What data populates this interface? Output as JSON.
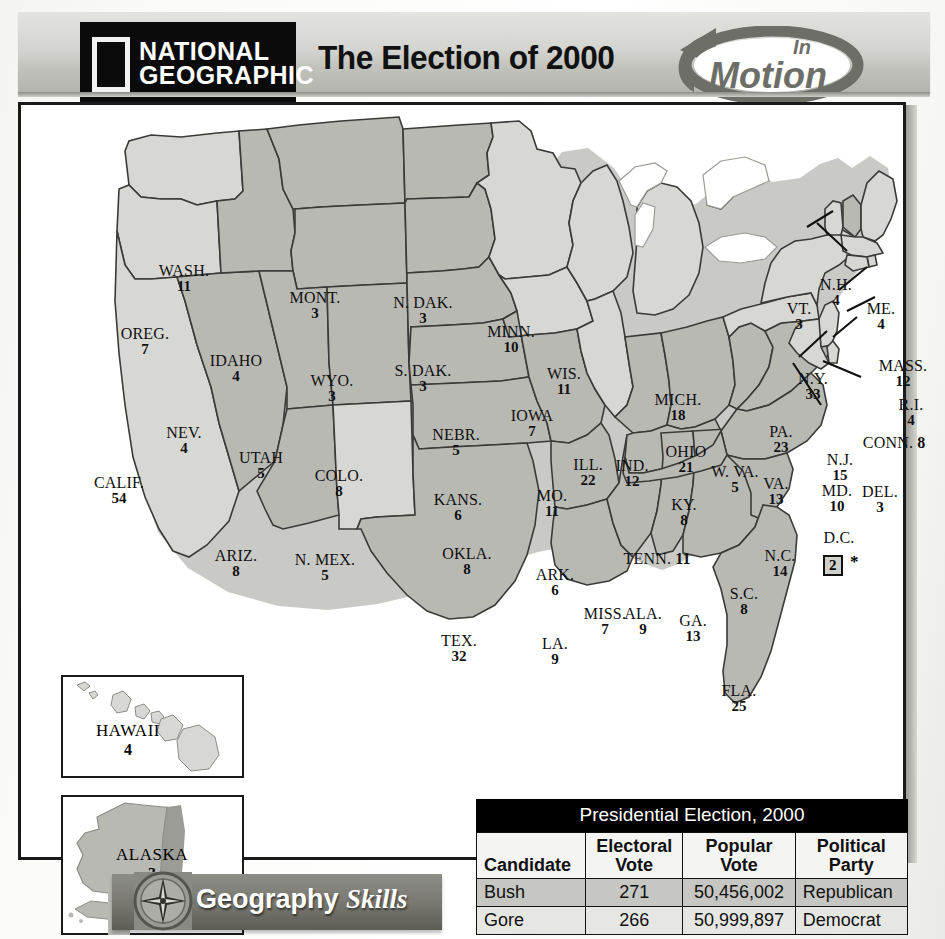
{
  "header": {
    "logo_line1": "NATIONAL",
    "logo_line2": "GEOGRAPHIC",
    "title": "The Election of 2000",
    "badge_line1": "In",
    "badge_line2": "Motion"
  },
  "map": {
    "title": "The Election of 2000",
    "legend": {
      "bush_fill": "#b9b9b4",
      "gore_fill": "#d7d7d3",
      "water_fill": "#ffffff",
      "coast_shadow": "#9c9c96",
      "border": "#3a3a38"
    },
    "states": [
      {
        "abbr": "WASH.",
        "votes": "11",
        "winner": "gore",
        "x": 163,
        "y": 158
      },
      {
        "abbr": "OREG.",
        "votes": "7",
        "winner": "gore",
        "x": 124,
        "y": 221
      },
      {
        "abbr": "CALIF.",
        "votes": "54",
        "winner": "gore",
        "x": 98,
        "y": 370
      },
      {
        "abbr": "NEV.",
        "votes": "4",
        "winner": "bush",
        "x": 163,
        "y": 320
      },
      {
        "abbr": "IDAHO",
        "votes": "4",
        "winner": "bush",
        "x": 215,
        "y": 248
      },
      {
        "abbr": "MONT.",
        "votes": "3",
        "winner": "bush",
        "x": 294,
        "y": 185
      },
      {
        "abbr": "WYO.",
        "votes": "3",
        "winner": "bush",
        "x": 311,
        "y": 268
      },
      {
        "abbr": "UTAH",
        "votes": "5",
        "winner": "bush",
        "x": 240,
        "y": 345
      },
      {
        "abbr": "COLO.",
        "votes": "8",
        "winner": "bush",
        "x": 318,
        "y": 363
      },
      {
        "abbr": "ARIZ.",
        "votes": "8",
        "winner": "bush",
        "x": 215,
        "y": 443
      },
      {
        "abbr": "N. MEX.",
        "votes": "5",
        "winner": "gore",
        "x": 304,
        "y": 447
      },
      {
        "abbr": "N. DAK.",
        "votes": "3",
        "winner": "bush",
        "x": 402,
        "y": 190
      },
      {
        "abbr": "S. DAK.",
        "votes": "3",
        "winner": "bush",
        "x": 402,
        "y": 258
      },
      {
        "abbr": "NEBR.",
        "votes": "5",
        "winner": "bush",
        "x": 435,
        "y": 322
      },
      {
        "abbr": "KANS.",
        "votes": "6",
        "winner": "bush",
        "x": 437,
        "y": 387
      },
      {
        "abbr": "OKLA.",
        "votes": "8",
        "winner": "bush",
        "x": 446,
        "y": 441
      },
      {
        "abbr": "TEX.",
        "votes": "32",
        "winner": "bush",
        "x": 438,
        "y": 528
      },
      {
        "abbr": "MINN.",
        "votes": "10",
        "winner": "gore",
        "x": 490,
        "y": 219
      },
      {
        "abbr": "IOWA",
        "votes": "7",
        "winner": "gore",
        "x": 511,
        "y": 303
      },
      {
        "abbr": "MO.",
        "votes": "11",
        "winner": "bush",
        "x": 531,
        "y": 383
      },
      {
        "abbr": "ARK.",
        "votes": "6",
        "winner": "bush",
        "x": 534,
        "y": 462
      },
      {
        "abbr": "LA.",
        "votes": "9",
        "winner": "bush",
        "x": 534,
        "y": 531
      },
      {
        "abbr": "WIS.",
        "votes": "11",
        "winner": "gore",
        "x": 543,
        "y": 261
      },
      {
        "abbr": "ILL.",
        "votes": "22",
        "winner": "gore",
        "x": 567,
        "y": 352
      },
      {
        "abbr": "MISS.",
        "votes": "7",
        "winner": "bush",
        "x": 584,
        "y": 501
      },
      {
        "abbr": "IND.",
        "votes": "12",
        "winner": "bush",
        "x": 611,
        "y": 353
      },
      {
        "abbr": "MICH.",
        "votes": "18",
        "winner": "gore",
        "x": 657,
        "y": 287
      },
      {
        "abbr": "OHIO",
        "votes": "21",
        "winner": "bush",
        "x": 665,
        "y": 339
      },
      {
        "abbr": "KY.",
        "votes": "8",
        "winner": "bush",
        "x": 663,
        "y": 392
      },
      {
        "abbr": "ALA.",
        "votes": "9",
        "winner": "bush",
        "x": 622,
        "y": 501
      },
      {
        "abbr": "GA.",
        "votes": "13",
        "winner": "bush",
        "x": 672,
        "y": 508
      },
      {
        "abbr": "W. VA.",
        "votes": "5",
        "winner": "bush",
        "x": 714,
        "y": 359
      },
      {
        "abbr": "VA.",
        "votes": "13",
        "winner": "bush",
        "x": 755,
        "y": 371
      },
      {
        "abbr": "N.C.",
        "votes": "14",
        "winner": "bush",
        "x": 759,
        "y": 443
      },
      {
        "abbr": "S.C.",
        "votes": "8",
        "winner": "bush",
        "x": 723,
        "y": 481
      },
      {
        "abbr": "FLA.",
        "votes": "25",
        "winner": "bush",
        "x": 718,
        "y": 578
      },
      {
        "abbr": "PA.",
        "votes": "23",
        "winner": "gore",
        "x": 760,
        "y": 319
      },
      {
        "abbr": "N.Y.",
        "votes": "33",
        "winner": "gore",
        "x": 792,
        "y": 266
      },
      {
        "abbr": "VT.",
        "votes": "3",
        "winner": "gore",
        "x": 778,
        "y": 196
      },
      {
        "abbr": "N.H.",
        "votes": "4",
        "winner": "bush",
        "x": 815,
        "y": 172
      },
      {
        "abbr": "ME.",
        "votes": "4",
        "winner": "gore",
        "x": 860,
        "y": 196
      },
      {
        "abbr": "MASS.",
        "votes": "12",
        "winner": "gore",
        "x": 882,
        "y": 253
      },
      {
        "abbr": "R.I.",
        "votes": "4",
        "winner": "gore",
        "x": 890,
        "y": 292
      },
      {
        "abbr": "CONN.",
        "votes": "8",
        "winner": "gore",
        "x": 873,
        "y": 330,
        "inline": true
      },
      {
        "abbr": "N.J.",
        "votes": "15",
        "winner": "gore",
        "x": 819,
        "y": 347
      },
      {
        "abbr": "DEL.",
        "votes": "3",
        "winner": "gore",
        "x": 859,
        "y": 379
      },
      {
        "abbr": "MD.",
        "votes": "10",
        "winner": "gore",
        "x": 816,
        "y": 378
      },
      {
        "abbr": "TENN.",
        "votes": "11",
        "winner": "bush",
        "x": 636,
        "y": 446,
        "inline": true
      }
    ],
    "dc": {
      "abbr": "D.C.",
      "votes": "2",
      "asterisk": "*",
      "winner": "gore"
    },
    "insets": [
      {
        "name": "HAWAII",
        "votes": "4",
        "winner": "gore"
      },
      {
        "name": "ALASKA",
        "votes": "3",
        "winner": "bush"
      }
    ]
  },
  "table": {
    "caption": "Presidential Election, 2000",
    "columns": [
      "Candidate",
      "Electoral Vote",
      "Popular Vote",
      "Political Party"
    ],
    "columns_wrapped": [
      [
        "",
        "Candidate"
      ],
      [
        "Electoral",
        "Vote"
      ],
      [
        "Popular",
        "Vote"
      ],
      [
        "Political",
        "Party"
      ]
    ],
    "rows": [
      {
        "candidate": "Bush",
        "electoral": "271",
        "popular": "50,456,002",
        "party": "Republican"
      },
      {
        "candidate": "Gore",
        "electoral": "266",
        "popular": "50,999,897",
        "party": "Democrat"
      }
    ]
  },
  "footnote": "* 1 elector from Washington, D.C., abstained.",
  "footer": {
    "word1": "Geography",
    "word2": "Skills"
  },
  "chart_data": {
    "type": "map",
    "title": "The Election of 2000",
    "subtitle": "Presidential Election, 2000 — electoral votes by state",
    "series": [
      {
        "name": "Bush (Republican)",
        "electoral_total": 271,
        "popular_total": 50456002
      },
      {
        "name": "Gore (Democrat)",
        "electoral_total": 266,
        "popular_total": 50999897
      }
    ],
    "categories": [
      "WASH.",
      "OREG.",
      "CALIF.",
      "NEV.",
      "IDAHO",
      "MONT.",
      "WYO.",
      "UTAH",
      "COLO.",
      "ARIZ.",
      "N. MEX.",
      "N. DAK.",
      "S. DAK.",
      "NEBR.",
      "KANS.",
      "OKLA.",
      "TEX.",
      "MINN.",
      "IOWA",
      "MO.",
      "ARK.",
      "LA.",
      "WIS.",
      "ILL.",
      "MISS.",
      "IND.",
      "MICH.",
      "OHIO",
      "KY.",
      "ALA.",
      "GA.",
      "W. VA.",
      "VA.",
      "N.C.",
      "S.C.",
      "FLA.",
      "PA.",
      "N.Y.",
      "VT.",
      "N.H.",
      "ME.",
      "MASS.",
      "R.I.",
      "CONN.",
      "N.J.",
      "DEL.",
      "MD.",
      "TENN.",
      "HAWAII",
      "ALASKA",
      "D.C."
    ],
    "values": [
      11,
      7,
      54,
      4,
      4,
      3,
      3,
      5,
      8,
      8,
      5,
      3,
      3,
      5,
      6,
      8,
      32,
      10,
      7,
      11,
      6,
      9,
      11,
      22,
      7,
      12,
      18,
      21,
      8,
      9,
      13,
      5,
      13,
      14,
      8,
      25,
      23,
      33,
      3,
      4,
      4,
      12,
      4,
      8,
      15,
      3,
      10,
      11,
      4,
      3,
      2
    ],
    "winner": [
      "gore",
      "gore",
      "gore",
      "bush",
      "bush",
      "bush",
      "bush",
      "bush",
      "bush",
      "bush",
      "gore",
      "bush",
      "bush",
      "bush",
      "bush",
      "bush",
      "bush",
      "gore",
      "gore",
      "bush",
      "bush",
      "bush",
      "gore",
      "gore",
      "bush",
      "bush",
      "gore",
      "bush",
      "bush",
      "bush",
      "bush",
      "bush",
      "bush",
      "bush",
      "bush",
      "bush",
      "gore",
      "gore",
      "gore",
      "bush",
      "gore",
      "gore",
      "gore",
      "gore",
      "gore",
      "gore",
      "gore",
      "bush",
      "gore",
      "bush",
      "gore"
    ],
    "xlabel": "State",
    "ylabel": "Electoral votes",
    "legend": [
      "Bush (darker shading)",
      "Gore (lighter shading)"
    ],
    "annotations": [
      "* 1 elector from Washington, D.C., abstained."
    ]
  }
}
